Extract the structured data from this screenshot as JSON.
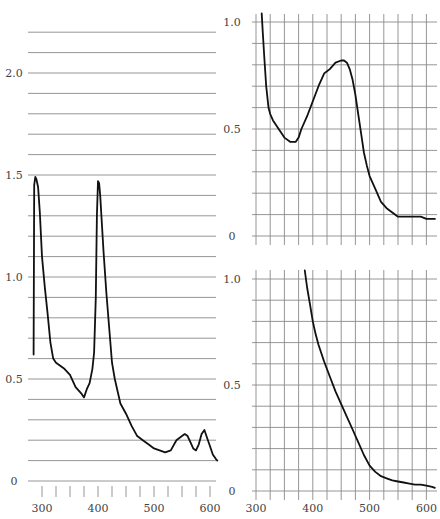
{
  "chart_data": [
    {
      "type": "line",
      "panel": "left",
      "title": "",
      "xlabel": "",
      "ylabel": "",
      "xlim": [
        285,
        615
      ],
      "ylim": [
        0,
        2.2
      ],
      "grid": true,
      "x_ticks": [
        "300",
        "400",
        "500",
        "600"
      ],
      "y_ticks": [
        "0",
        "0.5",
        "1.0",
        "1.5",
        "2.0"
      ],
      "series": [
        {
          "name": "spectrum",
          "x": [
            285,
            286,
            288,
            290,
            293,
            296,
            300,
            305,
            310,
            315,
            320,
            325,
            330,
            340,
            350,
            360,
            370,
            375,
            380,
            385,
            390,
            393,
            396,
            398,
            400,
            402,
            404,
            406,
            410,
            415,
            420,
            425,
            430,
            440,
            450,
            460,
            470,
            480,
            490,
            500,
            510,
            520,
            530,
            540,
            550,
            555,
            560,
            565,
            570,
            575,
            580,
            585,
            590,
            595,
            600,
            605,
            610,
            613
          ],
          "y": [
            0.62,
            1.45,
            1.49,
            1.48,
            1.44,
            1.32,
            1.1,
            0.95,
            0.82,
            0.68,
            0.6,
            0.58,
            0.57,
            0.55,
            0.52,
            0.46,
            0.43,
            0.41,
            0.45,
            0.48,
            0.55,
            0.63,
            0.9,
            1.3,
            1.47,
            1.46,
            1.4,
            1.3,
            1.12,
            0.92,
            0.75,
            0.58,
            0.5,
            0.38,
            0.33,
            0.27,
            0.22,
            0.2,
            0.18,
            0.16,
            0.15,
            0.14,
            0.15,
            0.2,
            0.22,
            0.23,
            0.22,
            0.19,
            0.16,
            0.15,
            0.18,
            0.23,
            0.25,
            0.21,
            0.17,
            0.13,
            0.11,
            0.1
          ]
        }
      ]
    },
    {
      "type": "line",
      "panel": "top-right",
      "title": "",
      "xlabel": "",
      "ylabel": "",
      "xlim": [
        290,
        615
      ],
      "ylim": [
        0,
        1.0
      ],
      "grid": true,
      "x_ticks": [],
      "y_ticks": [
        "0",
        "0.5",
        "1.0"
      ],
      "series": [
        {
          "name": "spectrum",
          "x": [
            310,
            312,
            315,
            318,
            322,
            325,
            330,
            340,
            350,
            360,
            370,
            375,
            380,
            390,
            400,
            410,
            420,
            425,
            430,
            440,
            450,
            455,
            460,
            465,
            470,
            475,
            480,
            485,
            490,
            495,
            500,
            510,
            520,
            530,
            540,
            550,
            560,
            570,
            580,
            590,
            600,
            610,
            615
          ],
          "y": [
            1.04,
            0.95,
            0.82,
            0.7,
            0.6,
            0.57,
            0.54,
            0.5,
            0.46,
            0.44,
            0.44,
            0.46,
            0.5,
            0.56,
            0.63,
            0.7,
            0.76,
            0.77,
            0.78,
            0.81,
            0.82,
            0.82,
            0.81,
            0.78,
            0.73,
            0.66,
            0.57,
            0.48,
            0.39,
            0.33,
            0.28,
            0.22,
            0.16,
            0.13,
            0.11,
            0.09,
            0.09,
            0.09,
            0.09,
            0.09,
            0.08,
            0.08,
            0.08
          ]
        }
      ]
    },
    {
      "type": "line",
      "panel": "bottom-right",
      "title": "",
      "xlabel": "",
      "ylabel": "",
      "xlim": [
        290,
        615
      ],
      "ylim": [
        0,
        1.0
      ],
      "grid": true,
      "x_ticks": [
        "300",
        "400",
        "500",
        "600"
      ],
      "y_ticks": [
        "0",
        "0.5",
        "1.0"
      ],
      "series": [
        {
          "name": "spectrum",
          "x": [
            386,
            390,
            395,
            400,
            405,
            410,
            420,
            430,
            440,
            450,
            460,
            470,
            480,
            490,
            500,
            510,
            520,
            530,
            540,
            550,
            560,
            570,
            580,
            590,
            600,
            610,
            615
          ],
          "y": [
            1.04,
            0.96,
            0.88,
            0.8,
            0.74,
            0.69,
            0.61,
            0.54,
            0.47,
            0.41,
            0.35,
            0.29,
            0.23,
            0.17,
            0.12,
            0.09,
            0.07,
            0.06,
            0.05,
            0.045,
            0.04,
            0.035,
            0.03,
            0.03,
            0.025,
            0.02,
            0.015
          ]
        }
      ]
    }
  ]
}
